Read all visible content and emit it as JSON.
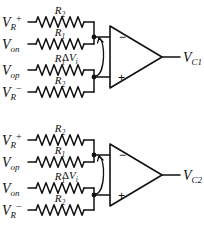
{
  "figure": {
    "type": "schematic",
    "background": "#ffffff",
    "stroke": "#111111"
  },
  "stages": [
    {
      "id": "stage-1",
      "output_label": {
        "base": "V",
        "sub": "C1"
      },
      "delta_label": {
        "delta": "Δ",
        "base": "V",
        "sub": "i"
      },
      "opamp": {
        "minus": "−",
        "plus": "+"
      },
      "inputs": [
        {
          "base": "V",
          "sub": "R",
          "sup": "+",
          "resistor": {
            "base": "R",
            "sub": "2"
          },
          "node": "minus"
        },
        {
          "base": "V",
          "sub": "on",
          "sup": "",
          "resistor": {
            "base": "R",
            "sub": "1"
          },
          "node": "minus"
        },
        {
          "base": "V",
          "sub": "op",
          "sup": "",
          "resistor": {
            "base": "R",
            "sub": "1"
          },
          "node": "plus"
        },
        {
          "base": "V",
          "sub": "R",
          "sup": "−",
          "resistor": {
            "base": "R",
            "sub": "2"
          },
          "node": "plus"
        }
      ]
    },
    {
      "id": "stage-2",
      "output_label": {
        "base": "V",
        "sub": "C2"
      },
      "delta_label": {
        "delta": "Δ",
        "base": "V",
        "sub": "i"
      },
      "opamp": {
        "minus": "−",
        "plus": "+"
      },
      "inputs": [
        {
          "base": "V",
          "sub": "R",
          "sup": "+",
          "resistor": {
            "base": "R",
            "sub": "2"
          },
          "node": "minus"
        },
        {
          "base": "V",
          "sub": "op",
          "sup": "",
          "resistor": {
            "base": "R",
            "sub": "1"
          },
          "node": "minus"
        },
        {
          "base": "V",
          "sub": "on",
          "sup": "",
          "resistor": {
            "base": "R",
            "sub": "1"
          },
          "node": "plus"
        },
        {
          "base": "V",
          "sub": "R",
          "sup": "−",
          "resistor": {
            "base": "R",
            "sub": "2"
          },
          "node": "plus"
        }
      ]
    }
  ]
}
